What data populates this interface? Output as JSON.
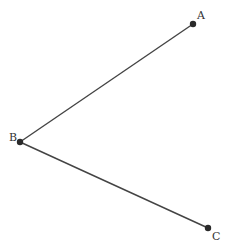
{
  "diagram": {
    "type": "angle",
    "points": [
      {
        "name": "A",
        "x": 193,
        "y": 24,
        "label_x": 197,
        "label_y": 19
      },
      {
        "name": "B",
        "x": 20,
        "y": 142,
        "label_x": 9,
        "label_y": 141
      },
      {
        "name": "C",
        "x": 208,
        "y": 228,
        "label_x": 212,
        "label_y": 240
      }
    ],
    "segments": [
      {
        "from": "B",
        "to": "A"
      },
      {
        "from": "B",
        "to": "C"
      }
    ],
    "colors": {
      "line": "#444444",
      "point": "#2a2a2a",
      "label": "#333333"
    }
  }
}
